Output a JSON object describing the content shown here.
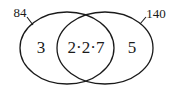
{
  "diagram": {
    "type": "venn",
    "stroke_color": "#1a1a1a",
    "background": "#ffffff",
    "sets": [
      {
        "id": "left",
        "label": "84",
        "ellipse": {
          "cx": 67,
          "cy": 48,
          "rx": 47,
          "ry": 36
        },
        "label_pos": {
          "x": 20,
          "y": 17
        },
        "leader": {
          "x1": 27,
          "y1": 17,
          "x2": 33,
          "y2": 25
        }
      },
      {
        "id": "right",
        "label": "140",
        "ellipse": {
          "cx": 105,
          "cy": 48,
          "rx": 48,
          "ry": 36
        },
        "label_pos": {
          "x": 156,
          "y": 18
        },
        "leader": {
          "x1": 146,
          "y1": 17,
          "x2": 140,
          "y2": 24
        }
      }
    ],
    "regions": [
      {
        "id": "left-only",
        "text": "3",
        "x": 41,
        "y": 53
      },
      {
        "id": "intersection",
        "text": "2·2·7",
        "x": 86,
        "y": 53
      },
      {
        "id": "right-only",
        "text": "5",
        "x": 132,
        "y": 53
      }
    ]
  }
}
